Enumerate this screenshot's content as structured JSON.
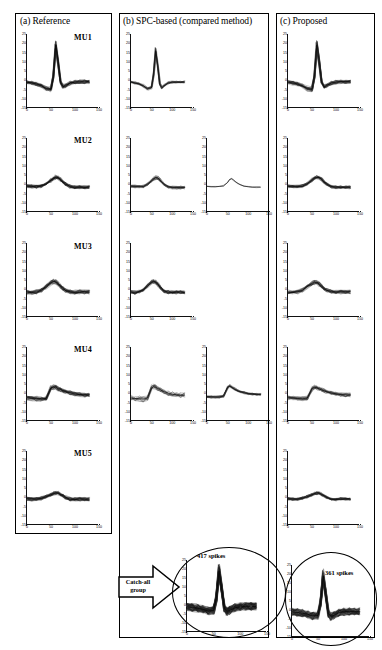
{
  "figure": {
    "panels": [
      {
        "id": "a",
        "title": "(a) Reference"
      },
      {
        "id": "b",
        "title": "(b) SPC-based (compared method)"
      },
      {
        "id": "c",
        "title": "(c) Proposed"
      }
    ],
    "row_labels": [
      "MU1",
      "MU2",
      "MU3",
      "MU4",
      "MU5"
    ],
    "annotations": {
      "catch_all": "Catch-all\ngroup",
      "catch_all_line1": "Catch-all",
      "catch_all_line2": "group",
      "spikes_spc": "417 spikes",
      "spikes_proposed": "361 spikes"
    },
    "colors": {
      "trace": "#1a1a1a",
      "trace_light": "#8c8c8c",
      "axis": "#111111",
      "border": "#000000"
    }
  },
  "chart_data": {
    "type": "line",
    "xlabel": "",
    "ylabel": "",
    "xlim": [
      0,
      150
    ],
    "ylim": [
      -15,
      25
    ],
    "xticks": [
      0,
      50,
      100,
      150
    ],
    "yticks": [
      25,
      20,
      15,
      10,
      5,
      0,
      -5,
      -10,
      -15
    ],
    "grid": false,
    "legend": "none",
    "x": [
      0,
      10,
      20,
      30,
      40,
      50,
      55,
      60,
      65,
      70,
      75,
      80,
      90,
      100,
      110,
      120,
      130
    ],
    "panels": [
      {
        "panel": "a",
        "panel_title": "(a) Reference",
        "plots": [
          {
            "row": "MU1",
            "col": 0,
            "n_traces": 34,
            "jitter": 2.0,
            "values": [
              -1,
              -1.5,
              -2,
              -3,
              -4.5,
              -5,
              2,
              19,
              10,
              -1,
              -3.5,
              -3,
              -1.5,
              -1,
              -0.8,
              -0.8,
              -0.8
            ]
          },
          {
            "row": "MU2",
            "col": 0,
            "n_traces": 34,
            "jitter": 1.8,
            "values": [
              -1,
              -1.2,
              -1.3,
              -1,
              0.2,
              2.2,
              3.2,
              3.8,
              3.6,
              2.6,
              1.2,
              0.2,
              -1.2,
              -1.6,
              -1.6,
              -1.6,
              -1.6
            ]
          },
          {
            "row": "MU3",
            "col": 0,
            "n_traces": 32,
            "jitter": 2.2,
            "values": [
              -1.5,
              -1.8,
              -1.5,
              -0.5,
              1.5,
              3.6,
              4.2,
              4.0,
              3.0,
              1.6,
              0.3,
              -0.6,
              -1.4,
              -1.6,
              -1.5,
              -1.5,
              -1.5
            ]
          },
          {
            "row": "MU4",
            "col": 0,
            "n_traces": 32,
            "jitter": 2.2,
            "values": [
              -2.5,
              -2.8,
              -3,
              -3.2,
              -2.8,
              2.8,
              3.4,
              3.2,
              2.6,
              2.0,
              1.5,
              1.0,
              0.2,
              -0.4,
              -0.8,
              -1.0,
              -1.0
            ]
          },
          {
            "row": "MU5",
            "col": 0,
            "n_traces": 36,
            "jitter": 2.0,
            "values": [
              -0.8,
              -1.0,
              -1.0,
              -0.6,
              0.3,
              1.4,
              2.0,
              2.3,
              2.2,
              1.6,
              0.8,
              0.0,
              -1.0,
              -1.2,
              -1.0,
              -1.0,
              -1.0
            ]
          }
        ]
      },
      {
        "panel": "b",
        "panel_title": "(b) SPC-based (compared method)",
        "plots": [
          {
            "row": "MU1",
            "col": 0,
            "n_traces": 20,
            "jitter": 1.2,
            "values": [
              -1,
              -1.5,
              -2,
              -3,
              -4.5,
              -4,
              3,
              16,
              8,
              -2,
              -4,
              -3,
              -1.5,
              -1,
              -1,
              -1,
              -1
            ]
          },
          {
            "row": "MU2",
            "col": 0,
            "n_traces": 30,
            "jitter": 1.4,
            "values": [
              -1,
              -1.2,
              -1.4,
              -1.2,
              0.0,
              2.0,
              3.0,
              3.6,
              3.4,
              2.4,
              1.0,
              0.0,
              -1.4,
              -1.8,
              -1.8,
              -1.8,
              -1.8
            ]
          },
          {
            "row": "MU2",
            "col": 1,
            "n_traces": 3,
            "jitter": 0.5,
            "values": [
              -1.2,
              -1.3,
              -1.3,
              -1.2,
              -0.9,
              1.0,
              2.6,
              3.0,
              2.2,
              1.2,
              0.4,
              -0.2,
              -1.0,
              -1.4,
              -1.6,
              -1.6,
              -1.6
            ]
          },
          {
            "row": "MU3",
            "col": 0,
            "n_traces": 30,
            "jitter": 1.8,
            "values": [
              -1.5,
              -1.8,
              -1.4,
              -0.3,
              1.8,
              3.8,
              4.2,
              3.8,
              2.6,
              1.2,
              0.0,
              -0.9,
              -1.6,
              -1.8,
              -1.6,
              -1.6,
              -1.6
            ]
          },
          {
            "row": "MU4",
            "col": 0,
            "n_traces": 14,
            "jitter": 2.6,
            "values": [
              -2.6,
              -2.8,
              -3.0,
              -3.2,
              -2.6,
              3.0,
              3.6,
              3.2,
              2.6,
              2.0,
              1.4,
              0.9,
              0.1,
              -0.5,
              -0.9,
              -1.0,
              -1.0
            ]
          },
          {
            "row": "MU4",
            "col": 1,
            "n_traces": 26,
            "jitter": 1.2,
            "values": [
              -1.8,
              -2.0,
              -2.0,
              -2.0,
              -1.6,
              3.2,
              3.8,
              3.2,
              2.4,
              1.8,
              1.2,
              0.8,
              0.2,
              -0.2,
              -0.5,
              -0.6,
              -0.6
            ]
          }
        ]
      },
      {
        "panel": "c",
        "panel_title": "(c) Proposed",
        "plots": [
          {
            "row": "MU1",
            "col": 0,
            "n_traces": 34,
            "jitter": 2.0,
            "values": [
              -1,
              -1.5,
              -2,
              -3,
              -4.5,
              -5,
              2,
              19,
              10,
              -1,
              -3.5,
              -3,
              -1.5,
              -1,
              -0.8,
              -0.8,
              -0.8
            ]
          },
          {
            "row": "MU2",
            "col": 0,
            "n_traces": 32,
            "jitter": 1.6,
            "values": [
              -1,
              -1.2,
              -1.3,
              -1,
              0.2,
              2.2,
              3.2,
              3.8,
              3.6,
              2.6,
              1.2,
              0.2,
              -1.2,
              -1.6,
              -1.6,
              -1.6,
              -1.6
            ]
          },
          {
            "row": "MU3",
            "col": 0,
            "n_traces": 30,
            "jitter": 2.0,
            "values": [
              -1.5,
              -1.8,
              -1.5,
              -0.5,
              1.4,
              3.2,
              3.8,
              3.6,
              2.8,
              1.6,
              0.4,
              -0.5,
              -1.3,
              -1.5,
              -1.4,
              -1.4,
              -1.4
            ]
          },
          {
            "row": "MU4",
            "col": 0,
            "n_traces": 30,
            "jitter": 2.0,
            "values": [
              -2.4,
              -2.6,
              -2.8,
              -3.0,
              -2.6,
              2.6,
              3.2,
              3.0,
              2.4,
              1.8,
              1.3,
              0.9,
              0.2,
              -0.3,
              -0.7,
              -0.9,
              -0.9
            ]
          },
          {
            "row": "MU5",
            "col": 0,
            "n_traces": 36,
            "jitter": 1.4,
            "values": [
              -0.8,
              -1.0,
              -1.0,
              -0.6,
              0.3,
              1.4,
              2.0,
              2.3,
              2.2,
              1.6,
              0.8,
              0.0,
              -1.0,
              -1.2,
              -1.0,
              -1.0,
              -1.0
            ]
          }
        ]
      }
    ],
    "catch_all_plots": [
      {
        "panel": "b",
        "label": "417 spikes",
        "n_traces": 110,
        "jitter": 4.4,
        "values": [
          -1,
          -1.4,
          -1.8,
          -2.4,
          -3.4,
          -3.0,
          4.0,
          19,
          9,
          -2.0,
          -3.6,
          -3.0,
          -1.6,
          -1.0,
          -0.8,
          -0.8,
          -0.8
        ]
      },
      {
        "panel": "c",
        "label": "361 spikes",
        "n_traces": 95,
        "jitter": 4.2,
        "values": [
          -1,
          -1.4,
          -1.8,
          -2.4,
          -3.4,
          -3.0,
          4.0,
          19,
          9,
          -2.0,
          -3.6,
          -3.0,
          -1.6,
          -1.0,
          -0.8,
          -0.8,
          -0.8
        ]
      }
    ]
  }
}
